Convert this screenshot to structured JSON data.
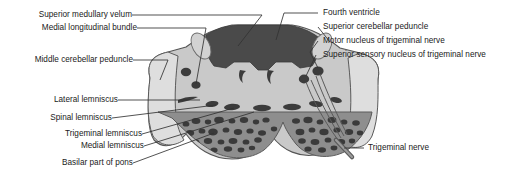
{
  "figure": {
    "background_color": "#ffffff",
    "text_color": "#1a1a1a",
    "leader_line_color": "#333333"
  },
  "palette": {
    "tegmentum_gray": "#c9c9c9",
    "peduncle_light": "#dcdcdc",
    "basilar_pons_gray": "#8e8e8e",
    "ventricle_dark": "#4a4a4a",
    "nuclei_dark": "#3c3c3c",
    "outline": "#555555"
  },
  "labels_left": [
    {
      "id": "superior-medullary-velum",
      "text": "Superior medullary velum"
    },
    {
      "id": "medial-longitudinal-bundle",
      "text": "Medial longitudinal bundle"
    },
    {
      "id": "middle-cerebellar-peduncle",
      "text": "Middle cerebellar peduncle"
    },
    {
      "id": "lateral-lemniscus",
      "text": "Lateral lemniscus"
    },
    {
      "id": "spinal-lemniscus",
      "text": "Spinal lemniscus"
    },
    {
      "id": "trigeminal-lemniscus",
      "text": "Trigeminal lemniscus"
    },
    {
      "id": "medial-lemniscus",
      "text": "Medial lemniscus"
    },
    {
      "id": "basilar-part-of-pons",
      "text": "Basilar part of pons"
    }
  ],
  "labels_right": [
    {
      "id": "fourth-ventricle",
      "text": "Fourth ventricle"
    },
    {
      "id": "superior-cerebellar-peduncle",
      "text": "Superior cerebellar peduncle"
    },
    {
      "id": "motor-nucleus-trigeminal",
      "text": "Motor nucleus of trigeminal nerve"
    },
    {
      "id": "superior-sensory-nucleus-trigeminal",
      "text": "Superior sensory nucleus of trigeminal nerve"
    },
    {
      "id": "trigeminal-nerve",
      "text": "Trigeminal nerve"
    }
  ]
}
